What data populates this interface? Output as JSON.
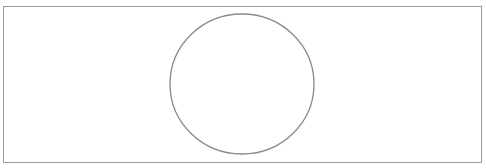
{
  "diagram": {
    "frame": {
      "x": 3.5,
      "y": 6.5,
      "width": 478,
      "height": 156,
      "stroke": "#9a9a9a",
      "stroke_width": 1,
      "fill": "#ffffff"
    },
    "shapes": [
      {
        "type": "ellipse",
        "cx": 242,
        "cy": 84,
        "rx": 72,
        "ry": 70,
        "stroke": "#8a8a8a",
        "stroke_width": 1.3,
        "fill": "none"
      }
    ]
  }
}
